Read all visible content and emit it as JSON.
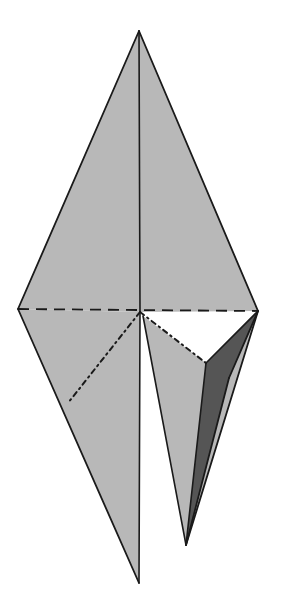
{
  "figure": {
    "kind": "3d-geometry-line-drawing",
    "background_color": "#ffffff",
    "canvas": {
      "width": 281,
      "height": 606
    },
    "palette": {
      "face_light_fill": "#b8b8b8",
      "face_dark_fill": "#555555",
      "edge_color": "#1a1a1a",
      "hidden_edge_color": "#1a1a1a",
      "background": "#ffffff"
    },
    "stroke_widths": {
      "outline": 1.8,
      "interior_solid": 1.6,
      "dashed": 1.8,
      "dashdot": 2.0
    },
    "dash_patterns": {
      "dashed": "11 7",
      "dashdot": "5 4 1.6 4"
    },
    "vertices": {
      "apex_top": {
        "label": "top apex",
        "x": 139,
        "y": 31
      },
      "equator_left": {
        "label": "left equator vertex",
        "x": 18,
        "y": 309
      },
      "equator_right": {
        "label": "right equator vertex",
        "x": 258,
        "y": 311
      },
      "center": {
        "label": "central vertex",
        "x": 140,
        "y": 312
      },
      "apex_bottom_left": {
        "label": "lower left apex",
        "x": 139,
        "y": 583
      },
      "apex_bottom_right": {
        "label": "lower right apex (flap tip)",
        "x": 186,
        "y": 545
      },
      "hidden_left": {
        "label": "hidden left fold vertex",
        "x": 68,
        "y": 403
      },
      "hidden_right": {
        "label": "hidden right fold vertex",
        "x": 206,
        "y": 363
      },
      "dark_outer_bend": {
        "label": "dark face outer bend",
        "x": 229,
        "y": 378
      },
      "notch_right_upper": {
        "label": "notch right upper",
        "x": 143,
        "y": 316
      },
      "notch_right_lower": {
        "label": "notch lower right",
        "x": 172,
        "y": 512
      },
      "lower_left_outer": {
        "label": "lower left outer edge anchor",
        "x": 18,
        "y": 309
      }
    },
    "faces": [
      {
        "name": "upper-left-face",
        "shade": "light",
        "fill": "#b8b8b8",
        "points": "139,31 18,309 140,312"
      },
      {
        "name": "upper-right-face",
        "shade": "light",
        "fill": "#b8b8b8",
        "points": "139,31 140,312 258,311"
      },
      {
        "name": "lower-left-face",
        "shade": "light",
        "fill": "#b8b8b8",
        "points": "18,309 139,583 140,312"
      },
      {
        "name": "lower-right-flap-light",
        "shade": "light",
        "fill": "#b8b8b8",
        "points": "143,316 206,363 258,311 186,545"
      },
      {
        "name": "lower-right-flap-dark",
        "shade": "dark",
        "fill": "#555555",
        "points": "258,311 229,378 186,545 206,363"
      }
    ],
    "edges": [
      {
        "name": "edge-apex-to-left",
        "style": "solid",
        "from": "apex_top",
        "to": "equator_left"
      },
      {
        "name": "edge-apex-to-right",
        "style": "solid",
        "from": "apex_top",
        "to": "equator_right"
      },
      {
        "name": "edge-apex-to-center",
        "style": "solid",
        "from": "apex_top",
        "to": "center"
      },
      {
        "name": "edge-left-to-bottom-left",
        "style": "solid",
        "from": "equator_left",
        "to": "apex_bottom_left"
      },
      {
        "name": "edge-center-to-bottom-left",
        "style": "solid",
        "from": "center",
        "to": "apex_bottom_left"
      },
      {
        "name": "edge-notch-to-bottom-right",
        "style": "solid",
        "from": "notch_right_upper",
        "to": "apex_bottom_right"
      },
      {
        "name": "edge-right-to-bottom-right",
        "style": "solid",
        "from": "equator_right",
        "to": "apex_bottom_right"
      },
      {
        "name": "edge-right-to-dark-bend",
        "style": "solid",
        "from": "equator_right",
        "to": "dark_outer_bend"
      },
      {
        "name": "edge-dark-bend-to-tip",
        "style": "solid",
        "from": "dark_outer_bend",
        "to": "apex_bottom_right"
      },
      {
        "name": "edge-hidden-right-to-tip",
        "style": "solid",
        "from": "hidden_right",
        "to": "apex_bottom_right"
      },
      {
        "name": "edge-hidden-right-to-equator-right",
        "style": "solid",
        "from": "hidden_right",
        "to": "equator_right"
      },
      {
        "name": "edge-equator-horizontal",
        "style": "dashed",
        "from": "equator_left",
        "to": "equator_right"
      },
      {
        "name": "edge-center-to-hidden-left",
        "style": "dashdot",
        "from": "center",
        "to": "hidden_left"
      },
      {
        "name": "edge-center-to-hidden-right",
        "style": "dashdot",
        "from": "center",
        "to": "hidden_right"
      },
      {
        "name": "edge-hidden-left-on-outline",
        "style": "solid",
        "from": "hidden_left",
        "to": "hidden_left"
      }
    ],
    "notch": {
      "name": "white-wedge-notch",
      "description": "white wedge separating the two lower lobes",
      "points": "140,312 143,316 172,512 139,583",
      "fill": "#ffffff"
    }
  }
}
